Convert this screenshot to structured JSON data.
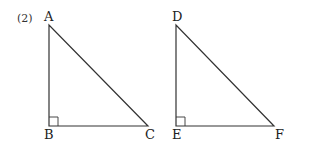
{
  "problem_number": "(2)",
  "triangles": [
    {
      "name": "triangle-ABC",
      "vertices": {
        "top": "A",
        "right_angle": "B",
        "right": "C"
      },
      "right_angle_at": "B"
    },
    {
      "name": "triangle-DEF",
      "vertices": {
        "top": "D",
        "right_angle": "E",
        "right": "F"
      },
      "right_angle_at": "E"
    }
  ],
  "colors": {
    "line": "#333333",
    "background": "#ffffff"
  }
}
